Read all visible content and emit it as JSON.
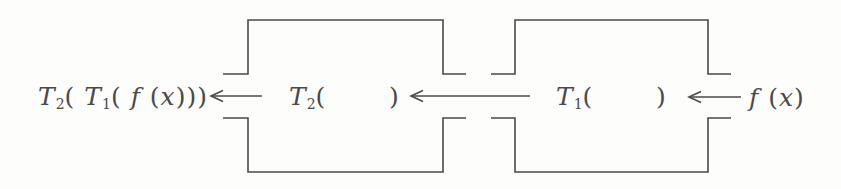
{
  "colors": {
    "ink": "#4a4a4a",
    "paper": "#fdfdfc"
  },
  "diagram": {
    "output_expression": {
      "tokens": [
        [
          "T",
          "i"
        ],
        [
          "2",
          "s"
        ],
        [
          "( ",
          "n"
        ],
        [
          "T",
          "i"
        ],
        [
          "1",
          "s"
        ],
        [
          "( ",
          "n"
        ],
        [
          "f",
          "i"
        ],
        [
          " (",
          "n"
        ],
        [
          "x",
          "i"
        ],
        [
          ")))",
          "n"
        ]
      ]
    },
    "machine1": {
      "tokens": [
        [
          "T",
          "i"
        ],
        [
          "2",
          "s"
        ],
        [
          "(",
          "n"
        ],
        [
          "       ",
          "n"
        ],
        [
          ")",
          "n"
        ]
      ]
    },
    "machine2": {
      "tokens": [
        [
          "T",
          "i"
        ],
        [
          "1",
          "s"
        ],
        [
          "(",
          "n"
        ],
        [
          "       ",
          "n"
        ],
        [
          ")",
          "n"
        ]
      ]
    },
    "input_expression": {
      "tokens": [
        [
          "f",
          "i"
        ],
        [
          " (",
          "n"
        ],
        [
          "x",
          "i"
        ],
        [
          ")",
          "n"
        ]
      ]
    }
  }
}
